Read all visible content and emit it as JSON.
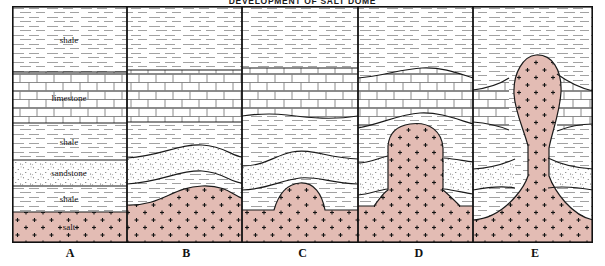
{
  "title": "DEVELOPMENT OF SALT DOME",
  "panels": [
    {
      "id": "A",
      "label": "A",
      "stage": "flat-layers"
    },
    {
      "id": "B",
      "label": "B",
      "stage": "salt-swell"
    },
    {
      "id": "C",
      "label": "C",
      "stage": "salt-pillow"
    },
    {
      "id": "D",
      "label": "D",
      "stage": "diapir-rising"
    },
    {
      "id": "E",
      "label": "E",
      "stage": "mature-dome"
    }
  ],
  "layers": [
    {
      "name": "shale-upper",
      "caption": "shale",
      "pattern": "dashes",
      "color": "#ffffff"
    },
    {
      "name": "limestone",
      "caption": "limestone",
      "pattern": "brick",
      "color": "#ffffff"
    },
    {
      "name": "shale-middle",
      "caption": "shale",
      "pattern": "dashes",
      "color": "#ffffff"
    },
    {
      "name": "sandstone",
      "caption": "sandstone",
      "pattern": "stipple",
      "color": "#ffffff"
    },
    {
      "name": "shale-lower",
      "caption": "shale",
      "pattern": "dashes",
      "color": "#ffffff"
    },
    {
      "name": "salt",
      "caption": "salt",
      "pattern": "crosses",
      "color": "#e3bcb4"
    }
  ],
  "colors": {
    "salt_fill": "#e3bcb4",
    "outline": "#1a1a1a",
    "pattern_line": "#6e6e6e",
    "background": "#ffffff"
  },
  "captions": {
    "shale_upper": "shale",
    "limestone": "limestone",
    "shale_middle": "shale",
    "sandstone": "sandstone",
    "shale_lower": "shale",
    "salt": "salt"
  }
}
